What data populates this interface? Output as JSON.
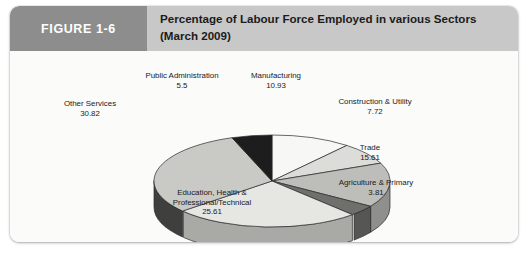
{
  "figure": {
    "tab_label": "FIGURE 1-6",
    "title_line1": "Percentage of Labour Force Employed in various Sectors",
    "title_line2": "(March 2009)"
  },
  "colors": {
    "tab_background": "#8d8d8d",
    "title_background": "#c8c8c8",
    "card_background": "#fbfbfa",
    "label_text": "#1a1a1a"
  },
  "chart_data": {
    "type": "pie",
    "title": "Percentage of Labour Force Employed in various Sectors (March 2009)",
    "subtitle": "(March 2009)",
    "three_d": true,
    "legend": "none",
    "value_unit": "percent",
    "categories": [
      "Manufacturing",
      "Construction & Utility",
      "Trade",
      "Agriculture & Primary",
      "Education, Health & Professional/Technical",
      "Other Services",
      "Public Administration"
    ],
    "values": [
      10.93,
      7.72,
      15.61,
      3.81,
      25.61,
      30.82,
      5.5
    ],
    "slices": [
      {
        "label_line1": "Manufacturing",
        "label_line2": "",
        "value": "10.93",
        "fill": "#f7f7f5",
        "side": "#c3c3c0"
      },
      {
        "label_line1": "Construction & Utility",
        "label_line2": "",
        "value": "7.72",
        "fill": "#dcdcd9",
        "side": "#b0b0ad"
      },
      {
        "label_line1": "Trade",
        "label_line2": "",
        "value": "15.61",
        "fill": "#bdbdba",
        "side": "#8f8f8c"
      },
      {
        "label_line1": "Agriculture & Primary",
        "label_line2": "",
        "value": "3.81",
        "fill": "#6f6f6c",
        "side": "#565654"
      },
      {
        "label_line1": "Education, Health &",
        "label_line2": "Professional/Technical",
        "value": "25.61",
        "fill": "#e6e6e3",
        "side": "#a9a9a6"
      },
      {
        "label_line1": "Other Services",
        "label_line2": "",
        "value": "30.82",
        "fill": "#c9c9c6",
        "side": "#3f3f3d"
      },
      {
        "label_line1": "Public Administration",
        "label_line2": "",
        "value": "5.5",
        "fill": "#1d1d1d",
        "side": "#141414"
      }
    ]
  }
}
